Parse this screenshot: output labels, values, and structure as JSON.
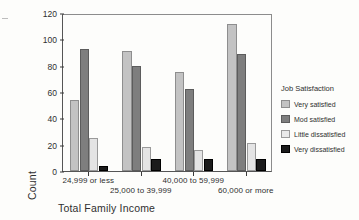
{
  "chart_data": {
    "type": "bar",
    "title": "",
    "xlabel": "Total Family Income",
    "ylabel": "Count",
    "ylim": [
      0,
      120
    ],
    "yticks": [
      0,
      20,
      40,
      60,
      80,
      100,
      120
    ],
    "grid": false,
    "legend_position": "right",
    "legend_title": "Job Satisfaction",
    "categories": [
      "24,999 or less",
      "25,000 to 39,999",
      "40,000 to 59,999",
      "60,000 or more"
    ],
    "series": [
      {
        "name": "Very satisfied",
        "color": "#c3c3c3",
        "values": [
          54,
          91,
          75,
          112
        ]
      },
      {
        "name": "Mod satisfied",
        "color": "#7e7e7e",
        "values": [
          93,
          80,
          62,
          89
        ]
      },
      {
        "name": "Little dissatisfied",
        "color": "#e4e4e4",
        "values": [
          25,
          18,
          16,
          21
        ]
      },
      {
        "name": "Very dissatisfied",
        "color": "#1b1b1b",
        "values": [
          4,
          9,
          9,
          9
        ]
      }
    ]
  },
  "axis": {
    "y_title": "Count",
    "x_title": "Total Family Income"
  },
  "legend": {
    "title": "Job Satisfaction",
    "items": [
      {
        "label": "Very satisfied"
      },
      {
        "label": "Mod satisfied"
      },
      {
        "label": "Little dissatisfied"
      },
      {
        "label": "Very dissatisfied"
      }
    ]
  }
}
